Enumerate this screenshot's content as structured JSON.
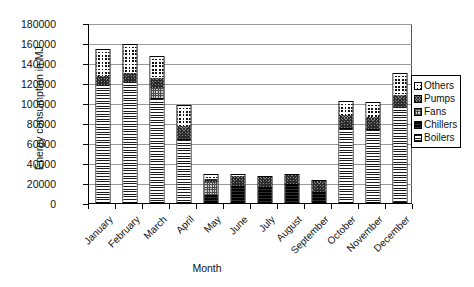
{
  "chart_data": {
    "type": "bar",
    "stacked": true,
    "title": "",
    "xlabel": "Month",
    "ylabel": "Energy consumption in MJ",
    "ylim": [
      0,
      180000
    ],
    "ytick_step": 20000,
    "yticks": [
      "0",
      "20000",
      "40000",
      "60000",
      "80000",
      "100000",
      "120000",
      "140000",
      "160000",
      "180000"
    ],
    "grid": true,
    "legend_position": "right",
    "categories": [
      "January",
      "February",
      "March",
      "April",
      "May",
      "June",
      "July",
      "August",
      "September",
      "October",
      "November",
      "December"
    ],
    "series": [
      {
        "name": "Boilers",
        "pattern": "horizontal-lines",
        "values": [
          117000,
          120000,
          103000,
          62000,
          0,
          0,
          0,
          0,
          0,
          73000,
          72000,
          95000
        ]
      },
      {
        "name": "Chillers",
        "pattern": "solid-dark",
        "values": [
          0,
          0,
          1000,
          1000,
          7000,
          16000,
          15000,
          18000,
          10000,
          1000,
          1000,
          0
        ]
      },
      {
        "name": "Fans",
        "pattern": "fine-grid",
        "values": [
          0,
          0,
          10000,
          0,
          13000,
          0,
          0,
          0,
          0,
          0,
          0,
          0
        ]
      },
      {
        "name": "Pumps",
        "pattern": "diagonal-cross",
        "values": [
          9000,
          9000,
          10000,
          13000,
          3000,
          10000,
          10000,
          9000,
          11000,
          13000,
          12000,
          12000
        ]
      },
      {
        "name": "Others",
        "pattern": "checkerboard",
        "values": [
          26000,
          28000,
          21000,
          20000,
          4000,
          1000,
          0,
          0,
          0,
          13000,
          14000,
          21000
        ]
      }
    ],
    "totals": [
      152000,
      157000,
      145000,
      96000,
      27000,
      27000,
      25000,
      27000,
      21000,
      100000,
      99000,
      128000
    ]
  },
  "legend": {
    "items": [
      {
        "label": "Others"
      },
      {
        "label": "Pumps"
      },
      {
        "label": "Fans"
      },
      {
        "label": "Chillers"
      },
      {
        "label": "Boilers"
      }
    ]
  }
}
